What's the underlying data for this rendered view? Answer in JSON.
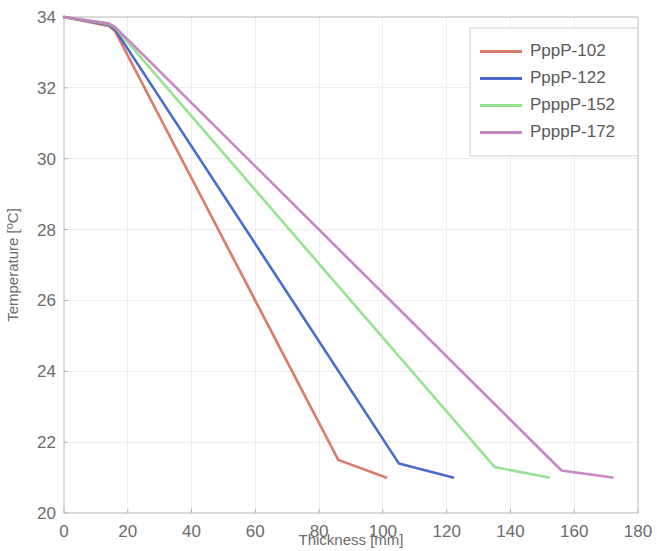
{
  "chart_data": {
    "type": "line",
    "title": "",
    "xlabel": "Thickness [mm]",
    "ylabel": "Temperature [°C]",
    "ylabel_parts": {
      "prefix": "Temperature [",
      "superscript": "o",
      "suffix": "C]"
    },
    "xlim": [
      0,
      180
    ],
    "ylim": [
      20,
      34
    ],
    "xticks": [
      0,
      20,
      40,
      60,
      80,
      100,
      120,
      140,
      160,
      180
    ],
    "yticks": [
      20,
      22,
      24,
      26,
      28,
      30,
      32,
      34
    ],
    "grid": true,
    "legend_position": "upper right",
    "series": [
      {
        "name": "PppP-102",
        "color": "#D9705E",
        "x": [
          0,
          14,
          16,
          86,
          101
        ],
        "y": [
          34.0,
          33.75,
          33.6,
          21.5,
          21.0
        ]
      },
      {
        "name": "PppP-122",
        "color": "#3A5FC8",
        "x": [
          0,
          14,
          16,
          105,
          122
        ],
        "y": [
          34.0,
          33.78,
          33.65,
          21.4,
          21.0
        ]
      },
      {
        "name": "PpppP-152",
        "color": "#8EE08A",
        "x": [
          0,
          14,
          16,
          135,
          152
        ],
        "y": [
          34.0,
          33.8,
          33.7,
          21.3,
          21.0
        ]
      },
      {
        "name": "PpppP-172",
        "color": "#C47CC0",
        "x": [
          0,
          14,
          16,
          156,
          172
        ],
        "y": [
          34.0,
          33.82,
          33.72,
          21.2,
          21.0
        ]
      }
    ]
  },
  "legend": {
    "entries": [
      {
        "label": "PppP-102",
        "color": "#D9705E"
      },
      {
        "label": "PppP-122",
        "color": "#3A5FC8"
      },
      {
        "label": "PpppP-152",
        "color": "#8EE08A"
      },
      {
        "label": "PpppP-172",
        "color": "#C47CC0"
      }
    ]
  }
}
